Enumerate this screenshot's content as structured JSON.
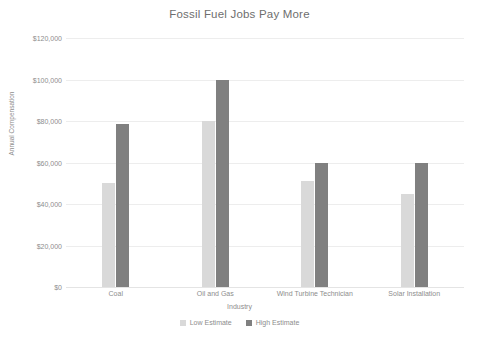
{
  "chart_data": {
    "type": "bar",
    "title": "Fossil Fuel Jobs Pay More",
    "xlabel": "Industry",
    "ylabel": "Annual Compensation",
    "categories": [
      "Coal",
      "Oil and Gas",
      "Wind Turbine Technician",
      "Solar Installation"
    ],
    "series": [
      {
        "name": "Low Estimate",
        "color": "#d9d9d9",
        "values": [
          50000,
          80000,
          51000,
          45000
        ]
      },
      {
        "name": "High Estimate",
        "color": "#808080",
        "values": [
          78500,
          100000,
          60000,
          60000
        ]
      }
    ],
    "ylim": [
      0,
      120000
    ],
    "ytick_values": [
      0,
      20000,
      40000,
      60000,
      80000,
      100000,
      120000
    ],
    "ytick_labels": [
      "$0",
      "$20,000",
      "$40,000",
      "$60,000",
      "$80,000",
      "$100,000",
      "$120,000"
    ],
    "grid": true,
    "legend_position": "bottom"
  }
}
